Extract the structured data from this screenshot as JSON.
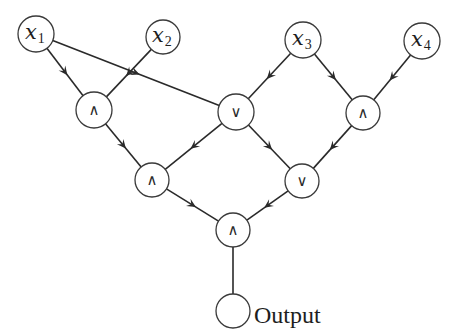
{
  "diagram": {
    "type": "boolean-circuit",
    "inputs": [
      {
        "id": "x1",
        "var": "x",
        "sub": "1",
        "cx": 36,
        "cy": 34,
        "r": 18
      },
      {
        "id": "x2",
        "var": "x",
        "sub": "2",
        "cx": 163,
        "cy": 37,
        "r": 17
      },
      {
        "id": "x3",
        "var": "x",
        "sub": "3",
        "cx": 303,
        "cy": 40,
        "r": 18
      },
      {
        "id": "x4",
        "var": "x",
        "sub": "4",
        "cx": 422,
        "cy": 41,
        "r": 18
      }
    ],
    "gates": [
      {
        "id": "and1",
        "op": "∧",
        "kind": "AND",
        "cx": 94,
        "cy": 110,
        "r": 18
      },
      {
        "id": "or1",
        "op": "∨",
        "kind": "OR",
        "cx": 236,
        "cy": 112,
        "r": 18
      },
      {
        "id": "and2",
        "op": "∧",
        "kind": "AND",
        "cx": 363,
        "cy": 113,
        "r": 17
      },
      {
        "id": "and3",
        "op": "∧",
        "kind": "AND",
        "cx": 152,
        "cy": 180,
        "r": 17
      },
      {
        "id": "or2",
        "op": "∨",
        "kind": "OR",
        "cx": 302,
        "cy": 181,
        "r": 17
      },
      {
        "id": "and4",
        "op": "∧",
        "kind": "AND",
        "cx": 233,
        "cy": 230,
        "r": 17
      }
    ],
    "output": {
      "id": "out",
      "label": "Output",
      "cx": 233,
      "cy": 311,
      "r": 17
    },
    "edges": [
      {
        "from": "x1",
        "to": "and1",
        "arrow": true
      },
      {
        "from": "x2",
        "to": "and1",
        "arrow": true
      },
      {
        "from": "x1",
        "to": "or1",
        "arrow": true
      },
      {
        "from": "x3",
        "to": "or1",
        "arrow": true
      },
      {
        "from": "x3",
        "to": "and2",
        "arrow": true
      },
      {
        "from": "x4",
        "to": "and2",
        "arrow": true
      },
      {
        "from": "and1",
        "to": "and3",
        "arrow": true
      },
      {
        "from": "or1",
        "to": "and3",
        "arrow": true
      },
      {
        "from": "or1",
        "to": "or2",
        "arrow": true
      },
      {
        "from": "and2",
        "to": "or2",
        "arrow": true
      },
      {
        "from": "and3",
        "to": "and4",
        "arrow": true
      },
      {
        "from": "or2",
        "to": "and4",
        "arrow": true
      },
      {
        "from": "and4",
        "to": "out",
        "arrow": false
      }
    ],
    "colors": {
      "stroke": "#2a2a2a",
      "node_fill": "#ffffff",
      "background": "#ffffff"
    }
  }
}
